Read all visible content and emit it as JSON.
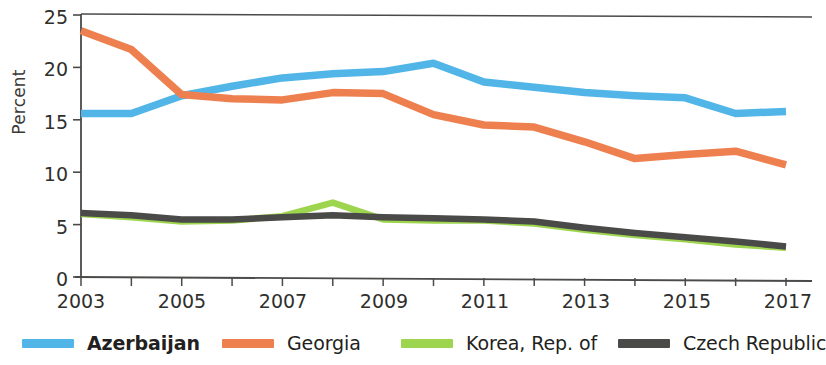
{
  "chart_data": {
    "type": "line",
    "title": "",
    "xlabel": "",
    "ylabel": "Percent",
    "xlim": [
      2003,
      2017
    ],
    "ylim": [
      0,
      25
    ],
    "yticks": [
      0,
      5,
      10,
      15,
      20,
      25
    ],
    "xticks": [
      2003,
      2005,
      2007,
      2009,
      2011,
      2013,
      2015,
      2017
    ],
    "x": [
      2003,
      2004,
      2005,
      2006,
      2007,
      2008,
      2009,
      2010,
      2011,
      2012,
      2013,
      2014,
      2015,
      2016,
      2017
    ],
    "grid": false,
    "legend_position": "bottom",
    "series": [
      {
        "name": "Azerbaijan",
        "color": "#52b5e8",
        "emphasis": "bold",
        "values": [
          15.6,
          15.6,
          17.3,
          18.2,
          19.0,
          19.4,
          19.6,
          20.4,
          18.6,
          18.1,
          17.6,
          17.3,
          17.1,
          15.6,
          15.8
        ]
      },
      {
        "name": "Georgia",
        "color": "#ee8050",
        "emphasis": "normal",
        "values": [
          23.5,
          21.7,
          17.4,
          17.0,
          16.9,
          17.6,
          17.5,
          15.5,
          14.5,
          14.3,
          12.9,
          11.3,
          11.7,
          12.0,
          10.7
        ]
      },
      {
        "name": "Korea, Rep. of",
        "color": "#9ed54e",
        "emphasis": "normal",
        "values": [
          6.0,
          5.7,
          5.3,
          5.4,
          5.8,
          7.1,
          5.5,
          5.4,
          5.4,
          5.1,
          4.5,
          4.0,
          3.6,
          3.1,
          2.8
        ]
      },
      {
        "name": "Czech Republic",
        "color": "#4a4a48",
        "emphasis": "normal",
        "values": [
          6.1,
          5.9,
          5.5,
          5.5,
          5.7,
          5.9,
          5.7,
          5.6,
          5.5,
          5.3,
          4.7,
          4.2,
          3.8,
          3.4,
          2.9
        ]
      }
    ]
  },
  "axes": {
    "ylabel": "Percent",
    "ytick_labels": [
      "25",
      "20",
      "15",
      "10",
      "5",
      "0"
    ],
    "xtick_labels": [
      "2003",
      "2005",
      "2007",
      "2009",
      "2011",
      "2013",
      "2015",
      "2017"
    ]
  },
  "legend": {
    "items": [
      {
        "label": "Azerbaijan",
        "color": "#52b5e8"
      },
      {
        "label": "Georgia",
        "color": "#ee8050"
      },
      {
        "label": "Korea, Rep. of",
        "color": "#9ed54e"
      },
      {
        "label": "Czech Republic",
        "color": "#4a4a48"
      }
    ]
  }
}
